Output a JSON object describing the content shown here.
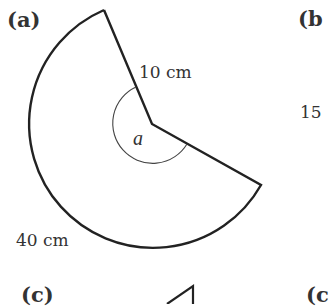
{
  "figure": {
    "parts": {
      "a": {
        "label": "(a)"
      },
      "b": {
        "label": "(b"
      },
      "c": {
        "label": "(c)"
      },
      "d": {
        "label": "(c"
      }
    },
    "sector_a": {
      "inner_radius_label": "10 cm",
      "outer_arc_label": "40 cm",
      "angle_label": "a",
      "center": [
        152,
        124
      ],
      "vertex_top": [
        104,
        10
      ],
      "vertex_right": [
        261,
        185
      ],
      "radius_px": 124
    },
    "part_b_partial_value": "15",
    "colors": {
      "stroke": "#222222",
      "text": "#333333",
      "background": "#ffffff"
    }
  }
}
